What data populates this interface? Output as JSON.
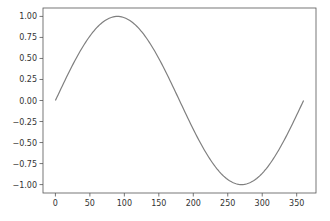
{
  "chart_data": {
    "type": "line",
    "title": "",
    "xlabel": "",
    "ylabel": "",
    "xlim": [
      -18,
      378
    ],
    "ylim": [
      -1.1,
      1.1
    ],
    "grid": false,
    "x_ticks": [
      0,
      50,
      100,
      150,
      200,
      250,
      300,
      350
    ],
    "y_ticks": [
      1.0,
      0.75,
      0.5,
      0.25,
      0.0,
      -0.25,
      -0.5,
      -0.75,
      -1.0
    ],
    "x_tick_labels": [
      "0",
      "50",
      "100",
      "150",
      "200",
      "250",
      "300",
      "350"
    ],
    "y_tick_labels": [
      "1.00",
      "0.75",
      "0.50",
      "0.25",
      "0.00",
      "−0.25",
      "−0.50",
      "−0.75",
      "−1.00"
    ],
    "series": [
      {
        "name": "sin(x)",
        "color": "#7f7f7f",
        "function": "sin(x degrees)",
        "x_range": [
          0,
          360
        ]
      }
    ]
  }
}
